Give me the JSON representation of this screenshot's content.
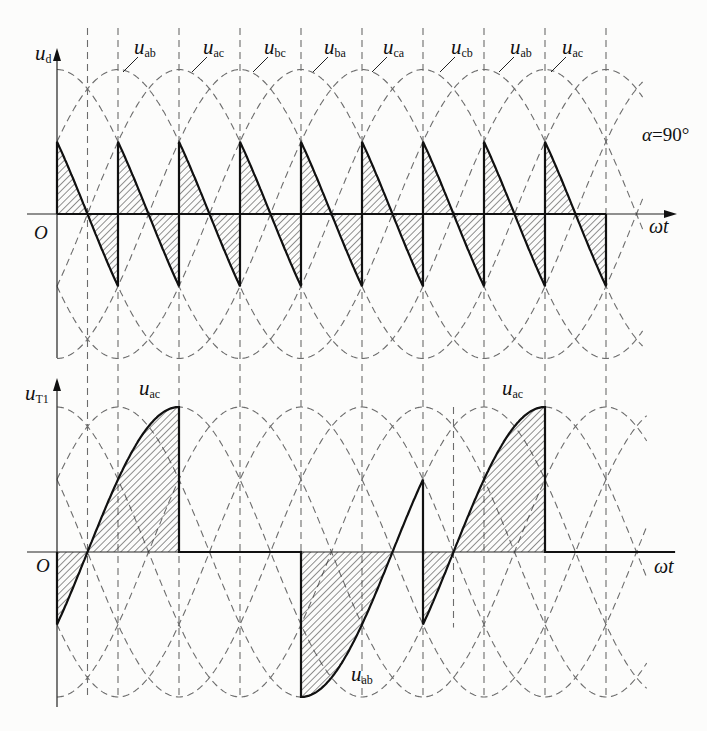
{
  "figure": {
    "top_panel": {
      "y_axis_label": {
        "symbol": "u",
        "sub": "d"
      },
      "x_axis_label": "ωt",
      "origin_label": "O",
      "annotation": {
        "symbol": "α",
        "text": "=90°"
      },
      "curve_labels": [
        {
          "symbol": "u",
          "sub": "ab",
          "at_deg": 60
        },
        {
          "symbol": "u",
          "sub": "ac",
          "at_deg": 120
        },
        {
          "symbol": "u",
          "sub": "bc",
          "at_deg": 180
        },
        {
          "symbol": "u",
          "sub": "ba",
          "at_deg": 240
        },
        {
          "symbol": "u",
          "sub": "ca",
          "at_deg": 300
        },
        {
          "symbol": "u",
          "sub": "cb",
          "at_deg": 360
        },
        {
          "symbol": "u",
          "sub": "ab",
          "at_deg": 420
        },
        {
          "symbol": "u",
          "sub": "ac",
          "at_deg": 480
        }
      ]
    },
    "bottom_panel": {
      "y_axis_label": {
        "symbol": "u",
        "sub": "T1"
      },
      "x_axis_label": "ωt",
      "origin_label": "O",
      "curve_labels": [
        {
          "symbol": "u",
          "sub": "ac"
        },
        {
          "symbol": "u",
          "sub": "ab"
        },
        {
          "symbol": "u",
          "sub": "ac"
        }
      ]
    }
  },
  "chart_data": [
    {
      "type": "line",
      "title": "",
      "xlabel": "ωt",
      "ylabel": "u_d",
      "x_unit": "degrees",
      "y_unit": "normalized to line-voltage peak",
      "xlim": [
        0,
        576
      ],
      "ylim": [
        -1,
        1
      ],
      "grid": false,
      "legend": "none (inline curve labels)",
      "annotations": [
        "α=90°"
      ],
      "line_voltages": [
        {
          "name": "u_ab",
          "peak_deg": 60
        },
        {
          "name": "u_ac",
          "peak_deg": 120
        },
        {
          "name": "u_bc",
          "peak_deg": 180
        },
        {
          "name": "u_ba",
          "peak_deg": 240
        },
        {
          "name": "u_ca",
          "peak_deg": 300
        },
        {
          "name": "u_cb",
          "peak_deg": 360
        }
      ],
      "vertical_markers_deg": [
        30,
        60,
        120,
        180,
        240,
        300,
        360,
        420,
        480,
        540
      ],
      "waveform_name": "u_d",
      "segments": [
        {
          "voltage": "u_ca",
          "from": 0,
          "to": 60,
          "hatch": "full"
        },
        {
          "voltage": "u_cb",
          "from": 60,
          "to": 120,
          "hatch": "full"
        },
        {
          "voltage": "u_ab",
          "from": 120,
          "to": 180,
          "hatch": "full"
        },
        {
          "voltage": "u_ac",
          "from": 180,
          "to": 240,
          "hatch": "full"
        },
        {
          "voltage": "u_bc",
          "from": 240,
          "to": 300,
          "hatch": "full"
        },
        {
          "voltage": "u_ba",
          "from": 300,
          "to": 360,
          "hatch": "full"
        },
        {
          "voltage": "u_ca",
          "from": 360,
          "to": 420,
          "hatch": "full"
        },
        {
          "voltage": "u_cb",
          "from": 420,
          "to": 480,
          "hatch": "full"
        },
        {
          "voltage": "u_ab",
          "from": 480,
          "to": 540,
          "hatch": "full"
        }
      ],
      "heavy_zero_line": [
        0,
        540
      ],
      "series": [
        {
          "name": "u_d",
          "x": [
            0,
            60,
            60,
            120,
            120,
            180,
            180,
            240,
            240,
            300,
            300,
            360,
            360,
            420,
            420,
            480,
            480,
            540,
            540
          ],
          "values": [
            0.5,
            -0.5,
            0.5,
            -0.5,
            0.5,
            -0.5,
            0.5,
            -0.5,
            0.5,
            -0.5,
            0.5,
            -0.5,
            0.5,
            -0.5,
            0.5,
            -0.5,
            0.5,
            -0.5,
            0
          ]
        }
      ]
    },
    {
      "type": "line",
      "title": "",
      "xlabel": "ωt",
      "ylabel": "u_T1",
      "x_unit": "degrees",
      "y_unit": "normalized to line-voltage peak",
      "xlim": [
        0,
        608
      ],
      "ylim": [
        -1,
        1
      ],
      "grid": false,
      "legend": "none (inline curve labels)",
      "line_voltages": [
        {
          "name": "u_ab",
          "peak_deg": 60
        },
        {
          "name": "u_ac",
          "peak_deg": 120
        },
        {
          "name": "u_bc",
          "peak_deg": 180
        },
        {
          "name": "u_ba",
          "peak_deg": 240
        },
        {
          "name": "u_ca",
          "peak_deg": 300
        },
        {
          "name": "u_cb",
          "peak_deg": 360
        }
      ],
      "extra_markers": [
        {
          "deg": 390,
          "from_value": 1.0,
          "to_value": -0.52
        }
      ],
      "waveform_name": "u_T1",
      "segments": [
        {
          "voltage": "u_ac",
          "from": 0,
          "to": 120,
          "hatch": "full"
        },
        {
          "voltage": null,
          "from": 120,
          "to": 240,
          "hatch": "none"
        },
        {
          "voltage": "u_ab",
          "from": 240,
          "to": 360,
          "hatch": "negative"
        },
        {
          "voltage": "u_ac",
          "from": 360,
          "to": 480,
          "hatch": "full"
        },
        {
          "voltage": null,
          "from": 480,
          "to": 608,
          "hatch": "none"
        }
      ],
      "series": [
        {
          "name": "u_T1",
          "x": [
            0,
            30,
            120,
            120,
            240,
            240,
            330,
            360,
            360,
            390,
            480,
            480,
            608
          ],
          "values": [
            -0.5,
            0,
            1,
            0,
            0,
            -1,
            0,
            0.5,
            -0.5,
            0,
            1,
            0,
            0
          ]
        }
      ]
    }
  ]
}
